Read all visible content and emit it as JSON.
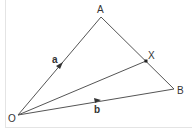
{
  "diagram": {
    "type": "vector geometry triangle",
    "points": {
      "O": {
        "label": "O",
        "x": 18,
        "y": 115
      },
      "A": {
        "label": "A",
        "x": 101,
        "y": 17
      },
      "B": {
        "label": "B",
        "x": 174,
        "y": 89
      },
      "X": {
        "label": "X",
        "x": 146,
        "y": 61
      }
    },
    "segments": [
      {
        "from": "O",
        "to": "A",
        "vector_label": "a",
        "arrow": true
      },
      {
        "from": "O",
        "to": "B",
        "vector_label": "b",
        "arrow": true
      },
      {
        "from": "A",
        "to": "B",
        "arrow": false
      },
      {
        "from": "O",
        "to": "X",
        "arrow": false
      }
    ],
    "vectors": {
      "a": "a",
      "b": "b"
    },
    "colors": {
      "line": "#555555",
      "text": "#333333",
      "background": "#ffffff"
    }
  }
}
